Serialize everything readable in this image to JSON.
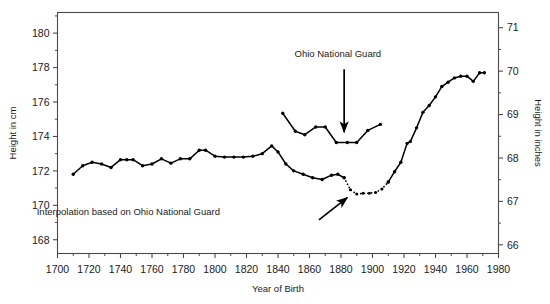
{
  "chart_data": {
    "type": "line",
    "title": "",
    "xlabel": "Year of Birth",
    "ylabel": "Height in cm",
    "y2label": "Height in inches",
    "xlim": [
      1700,
      1980
    ],
    "ylim": [
      167.2,
      181.2
    ],
    "y2lim": [
      65.8,
      71.35
    ],
    "xticks": [
      1700,
      1720,
      1740,
      1760,
      1780,
      1800,
      1820,
      1840,
      1860,
      1880,
      1900,
      1920,
      1940,
      1960,
      1980
    ],
    "xticklabels": [
      "1700",
      "1720",
      "1740",
      "1760",
      "1780",
      "1800",
      "1820",
      "1840",
      "1860",
      "1880",
      "1900",
      "1920",
      "1940",
      "1960",
      "1980"
    ],
    "yticks": [
      168,
      170,
      172,
      174,
      176,
      178,
      180
    ],
    "yticklabels": [
      "168",
      "170",
      "172",
      "174",
      "176",
      "178",
      "180"
    ],
    "y2ticks": [
      66,
      67,
      68,
      69,
      70,
      71
    ],
    "y2ticklabels": [
      "66",
      "67",
      "68",
      "69",
      "70",
      "71"
    ],
    "grid": false,
    "legend": false,
    "series": [
      {
        "name": "main-height-series",
        "style": "solid-with-markers",
        "color": "#000000",
        "points": [
          [
            1710,
            171.8
          ],
          [
            1716,
            172.3
          ],
          [
            1722,
            172.5
          ],
          [
            1728,
            172.4
          ],
          [
            1734,
            172.2
          ],
          [
            1740,
            172.65
          ],
          [
            1744,
            172.65
          ],
          [
            1748,
            172.65
          ],
          [
            1754,
            172.3
          ],
          [
            1760,
            172.4
          ],
          [
            1766,
            172.7
          ],
          [
            1772,
            172.45
          ],
          [
            1778,
            172.7
          ],
          [
            1784,
            172.7
          ],
          [
            1790,
            173.2
          ],
          [
            1794,
            173.2
          ],
          [
            1800,
            172.85
          ],
          [
            1806,
            172.8
          ],
          [
            1812,
            172.8
          ],
          [
            1818,
            172.8
          ],
          [
            1824,
            172.85
          ],
          [
            1830,
            173.0
          ],
          [
            1836,
            173.45
          ],
          [
            1840,
            173.1
          ],
          [
            1845,
            172.4
          ],
          [
            1850,
            172.0
          ],
          [
            1856,
            171.8
          ],
          [
            1862,
            171.6
          ],
          [
            1868,
            171.5
          ],
          [
            1874,
            171.75
          ],
          [
            1878,
            171.8
          ],
          [
            1882,
            171.6
          ]
        ]
      },
      {
        "name": "interpolation-dotted-segment",
        "style": "dotted-with-markers",
        "color": "#000000",
        "points": [
          [
            1882,
            171.6
          ],
          [
            1886,
            170.9
          ],
          [
            1890,
            170.65
          ],
          [
            1894,
            170.7
          ],
          [
            1898,
            170.7
          ],
          [
            1902,
            170.75
          ],
          [
            1906,
            170.95
          ],
          [
            1910,
            171.35
          ]
        ]
      },
      {
        "name": "modern-height-series",
        "style": "solid-with-markers",
        "color": "#000000",
        "points": [
          [
            1910,
            171.35
          ],
          [
            1914,
            171.95
          ],
          [
            1918,
            172.5
          ],
          [
            1922,
            173.6
          ],
          [
            1924,
            173.7
          ],
          [
            1928,
            174.5
          ],
          [
            1932,
            175.4
          ],
          [
            1936,
            175.8
          ],
          [
            1940,
            176.3
          ],
          [
            1944,
            176.9
          ],
          [
            1948,
            177.15
          ],
          [
            1952,
            177.4
          ],
          [
            1956,
            177.5
          ],
          [
            1960,
            177.5
          ],
          [
            1964,
            177.2
          ],
          [
            1968,
            177.7
          ],
          [
            1971,
            177.7
          ]
        ]
      },
      {
        "name": "ohio-national-guard-series",
        "style": "solid-with-markers",
        "color": "#000000",
        "points": [
          [
            1843,
            175.35
          ],
          [
            1851,
            174.3
          ],
          [
            1857,
            174.1
          ],
          [
            1864,
            174.55
          ],
          [
            1870,
            174.55
          ],
          [
            1877,
            173.65
          ],
          [
            1884,
            173.65
          ],
          [
            1890,
            173.65
          ],
          [
            1897,
            174.35
          ],
          [
            1905,
            174.7
          ]
        ]
      }
    ],
    "annotations": [
      {
        "name": "ohio-national-guard-label",
        "text": "Ohio National Guard",
        "x": 1878,
        "y": 178.6,
        "arrow": {
          "from_x": 1882,
          "from_y": 177.9,
          "to_x": 1882,
          "to_y": 174.25
        }
      },
      {
        "name": "interpolation-label",
        "text": "Interpolation based on Ohio National Guard",
        "x": 1745,
        "y": 169.45,
        "arrow": {
          "from_x": 1866,
          "from_y": 169.15,
          "to_x": 1884,
          "to_y": 170.45
        }
      }
    ]
  }
}
